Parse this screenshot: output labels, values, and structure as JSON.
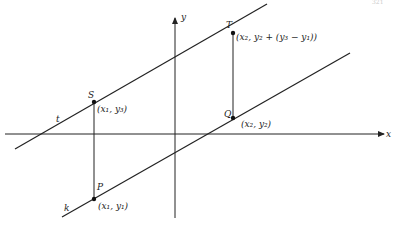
{
  "page_number": "321",
  "axes": {
    "x_label": "x",
    "y_label": "y"
  },
  "lines": [
    {
      "id": "t",
      "label": "t"
    },
    {
      "id": "k",
      "label": "k"
    }
  ],
  "points": {
    "S": {
      "name": "S",
      "coords": "(x₁, y₃)"
    },
    "P": {
      "name": "P",
      "coords": "(x₁, y₁)"
    },
    "T": {
      "name": "T",
      "coords": "(x₂, y₂ + (y₃ − y₁))"
    },
    "Q": {
      "name": "Q",
      "coords": "(x₂, y₂)"
    }
  }
}
